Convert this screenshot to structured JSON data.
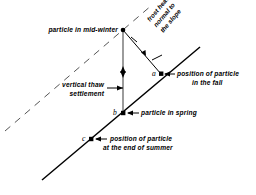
{
  "figure": {
    "background_color": "#ffffff",
    "line_color": "#000000",
    "dash_color": "#555555"
  },
  "labels": {
    "mid_winter": "particle in mid-winter",
    "frost_heave_l1": "frost heave",
    "frost_heave_l2": "normal to",
    "frost_heave_l3": "the slope",
    "thaw_settlement_l1": "vertical thaw",
    "thaw_settlement_l2": "settlement",
    "fall_l1": "position of particle",
    "fall_l2": "in the fall",
    "spring": "particle in spring",
    "summer_l1": "position of particle",
    "summer_l2": "at the end of summer"
  },
  "points": {
    "a": "a",
    "b": "b",
    "c": "c"
  },
  "geometry": {
    "mid_winter_point": "123,30",
    "point_a": "161,74",
    "point_b": "123,113",
    "point_c": "91,139",
    "slope_start": "42,180",
    "slope_end": "200,47",
    "dashed_start": "5,131",
    "dashed_end": "152,5"
  }
}
